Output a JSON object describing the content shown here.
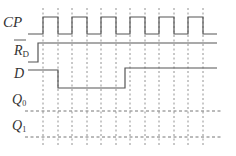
{
  "diagram": {
    "type": "timing-diagram",
    "signals": [
      {
        "id": "cp",
        "label": "CP",
        "subscript": "",
        "overline": false
      },
      {
        "id": "rd",
        "label": "R",
        "subscript": "D",
        "overline": true
      },
      {
        "id": "d",
        "label": "D",
        "subscript": "",
        "overline": false
      },
      {
        "id": "q0",
        "label": "Q",
        "subscript": "0",
        "overline": false
      },
      {
        "id": "q1",
        "label": "Q",
        "subscript": "1",
        "overline": false
      }
    ],
    "cp_pulses": 6,
    "cp_rising_edges_x": [
      43,
      72,
      101,
      130,
      159,
      188
    ],
    "cp_falling_edges_x": [
      58,
      87,
      116,
      145,
      174,
      203
    ],
    "rd_rise_x": 38,
    "d_fall_x": 58,
    "d_rise_x": 125,
    "colors": {
      "line": "#555555",
      "dash": "#666666",
      "text": "#333333"
    }
  }
}
